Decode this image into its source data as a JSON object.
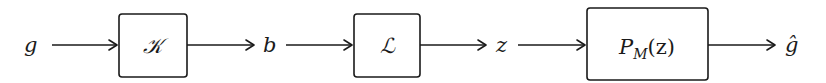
{
  "diagram": {
    "type": "block-diagram",
    "direction": "left-to-right",
    "signals": {
      "input": "g",
      "b": "b",
      "z": "z",
      "output": "ĝ"
    },
    "blocks": [
      {
        "id": "K",
        "label": "𝒦"
      },
      {
        "id": "L",
        "label": "ℒ"
      },
      {
        "id": "P",
        "label_main": "P",
        "label_sub": "M",
        "label_arg": "(z)"
      }
    ],
    "edges": [
      {
        "from": "g",
        "to": "K"
      },
      {
        "from": "K",
        "to": "b"
      },
      {
        "from": "b",
        "to": "L"
      },
      {
        "from": "L",
        "to": "z"
      },
      {
        "from": "z",
        "to": "P"
      },
      {
        "from": "P",
        "to": "ĝ"
      }
    ],
    "colors": {
      "stroke": "#1a1a1a",
      "background": "#ffffff"
    }
  }
}
